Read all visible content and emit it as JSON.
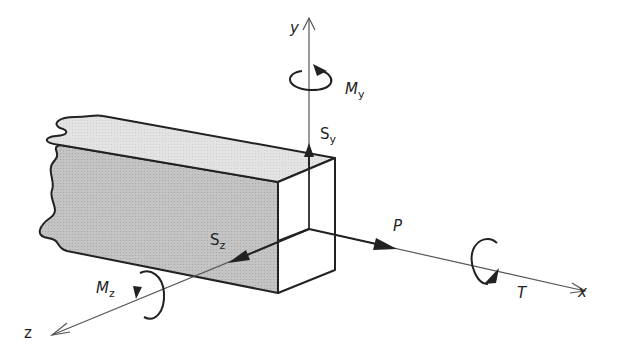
{
  "diagram": {
    "axes": {
      "x": "x",
      "y": "y",
      "z": "z"
    },
    "forces": {
      "P": "P",
      "Sy_main": "S",
      "Sy_sub": "y",
      "Sz_main": "S",
      "Sz_sub": "z"
    },
    "moments": {
      "My_main": "M",
      "My_sub": "y",
      "Mz_main": "M",
      "Mz_sub": "z",
      "T": "T"
    },
    "colors": {
      "beam_side": "#bdbdbd",
      "beam_top": "#e0e0e0",
      "line": "#222222",
      "axis": "#555555"
    }
  }
}
